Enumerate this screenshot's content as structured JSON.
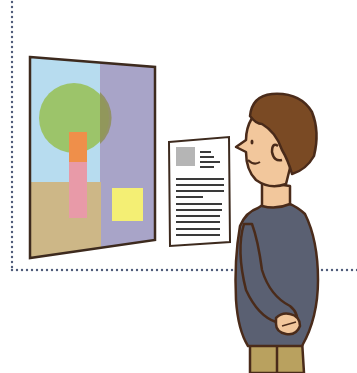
{
  "scene": {
    "description": "Man in a dark jacket viewing a framed abstract painting next to an information placard in a gallery",
    "painting": {
      "label": "abstract painting",
      "colors": {
        "frame": "#3d2a1e",
        "sky": "#b7dcef",
        "right_panel": "#a8a4c8",
        "ground": "#cdb787",
        "tree_crown": "#9cc46a",
        "trunk_upper": "#ef8f4a",
        "trunk_lower": "#e89aa8",
        "square": "#f4ef74"
      }
    },
    "placard": {
      "label": "information placard",
      "thumbnail_color": "#b5b5b5",
      "text_color": "#3a3a3a"
    },
    "person": {
      "label": "gallery visitor",
      "colors": {
        "hair": "#7a4a24",
        "skin": "#f2c79c",
        "jacket": "#5a6072",
        "trousers": "#b9a15f",
        "outline": "#4a2b1a"
      }
    },
    "wall_border_color": "#4d5a78"
  }
}
